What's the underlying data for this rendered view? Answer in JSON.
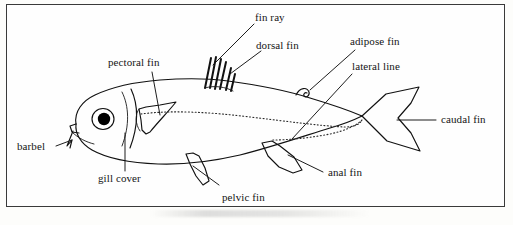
{
  "figure": {
    "border_color": "#3a3a3a",
    "background_color": "#fefefe",
    "ink_color": "#111111"
  },
  "labels": {
    "fin_ray": "fin ray",
    "dorsal_fin": "dorsal fin",
    "adipose_fin": "adipose fin",
    "lateral_line": "lateral line",
    "pectoral_fin": "pectoral fin",
    "caudal_fin": "caudal fin",
    "barbel": "barbel",
    "gill_cover": "gill cover",
    "pelvic_fin": "pelvic fin",
    "anal_fin": "anal fin"
  }
}
